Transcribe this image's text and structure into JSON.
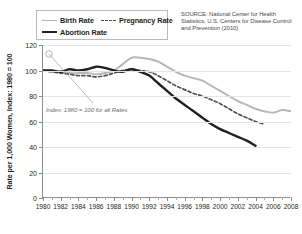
{
  "legend": {
    "items": [
      {
        "label": "Birth Rate",
        "style": "solid-light",
        "color": "#b6b6b6"
      },
      {
        "label": "Pregnancy Rate",
        "style": "dashed",
        "color": "#555152"
      },
      {
        "label": "Abortion Rate",
        "style": "solid-dark",
        "color": "#231f20"
      }
    ]
  },
  "source": {
    "text": "SOURCE: National Center for Health Statistics, U.S. Centers for Disease Control and Prevention (2010)"
  },
  "annotation": {
    "text": "Index: 1980 = 100 for all Rates"
  },
  "chart_data": {
    "type": "line",
    "title": "",
    "xlabel": "",
    "ylabel": "Rate per 1,000 Women, Index: 1980 = 100",
    "xlim": [
      1980,
      2008
    ],
    "ylim": [
      0,
      120
    ],
    "yticks": [
      0,
      20,
      40,
      60,
      80,
      100,
      120
    ],
    "xticks": [
      1980,
      1982,
      1984,
      1986,
      1988,
      1990,
      1992,
      1994,
      1996,
      1998,
      2000,
      2002,
      2004,
      2006,
      2008
    ],
    "grid": "horizontal",
    "legend_position": "top-left",
    "annotations": [
      "Index: 1980 = 100 for all Rates"
    ],
    "series": [
      {
        "name": "Birth Rate",
        "color": "#b6b6b6",
        "style": "solid",
        "x": [
          1980,
          1981,
          1982,
          1983,
          1984,
          1985,
          1986,
          1987,
          1988,
          1989,
          1990,
          1991,
          1992,
          1993,
          1994,
          1995,
          1996,
          1997,
          1998,
          1999,
          2000,
          2001,
          2002,
          2003,
          2004,
          2005,
          2006,
          2007,
          2008
        ],
        "y": [
          100,
          99,
          99,
          98,
          98,
          98,
          97,
          98,
          100,
          105,
          110,
          110,
          109,
          107,
          103,
          99,
          96,
          94,
          92,
          88,
          84,
          80,
          76,
          73,
          70,
          68,
          67,
          69,
          68
        ]
      },
      {
        "name": "Pregnancy Rate",
        "color": "#555152",
        "style": "dashed",
        "x": [
          1980,
          1981,
          1982,
          1983,
          1984,
          1985,
          1986,
          1987,
          1988,
          1989,
          1990,
          1991,
          1992,
          1993,
          1994,
          1995,
          1996,
          1997,
          1998,
          1999,
          2000,
          2001,
          2002,
          2003,
          2004,
          2005
        ],
        "y": [
          100,
          99,
          98,
          97,
          96,
          96,
          95,
          96,
          98,
          100,
          101,
          100,
          99,
          96,
          92,
          88,
          85,
          82,
          80,
          77,
          74,
          70,
          66,
          63,
          60,
          58
        ]
      },
      {
        "name": "Abortion Rate",
        "color": "#231f20",
        "style": "solid",
        "x": [
          1980,
          1981,
          1982,
          1983,
          1984,
          1985,
          1986,
          1987,
          1988,
          1989,
          1990,
          1991,
          1992,
          1993,
          1994,
          1995,
          1996,
          1997,
          1998,
          1999,
          2000,
          2001,
          2002,
          2003,
          2004
        ],
        "y": [
          100,
          100,
          99,
          101,
          100,
          101,
          103,
          102,
          100,
          99,
          101,
          99,
          96,
          90,
          84,
          78,
          73,
          68,
          63,
          58,
          54,
          51,
          48,
          45,
          41
        ]
      }
    ]
  },
  "axis": {
    "ytitle": "Rate per 1,000 Women, Index: 1980 = 100"
  }
}
